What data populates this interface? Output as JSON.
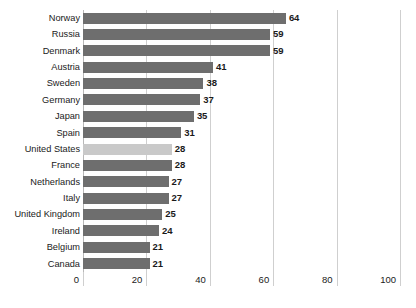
{
  "chart_data": {
    "type": "bar",
    "orientation": "horizontal",
    "title": "",
    "subtitle": "",
    "xlabel": "",
    "ylabel": "",
    "xlim": [
      0,
      100
    ],
    "xticks": [
      0,
      20,
      40,
      60,
      80,
      100
    ],
    "xtick_labels": [
      "0",
      "20",
      "40",
      "60",
      "80",
      "100"
    ],
    "grid": "vertical",
    "legend": "none",
    "categories": [
      "Norway",
      "Russia",
      "Denmark",
      "Austria",
      "Sweden",
      "Germany",
      "Japan",
      "Spain",
      "United States",
      "France",
      "Netherlands",
      "Italy",
      "United Kingdom",
      "Ireland",
      "Belgium",
      "Canada"
    ],
    "values": [
      64,
      59,
      59,
      41,
      38,
      37,
      35,
      31,
      28,
      28,
      27,
      27,
      25,
      24,
      21,
      21
    ],
    "value_labels": [
      "64",
      "59",
      "59",
      "41",
      "38",
      "37",
      "35",
      "31",
      "28",
      "28",
      "27",
      "27",
      "25",
      "24",
      "21",
      "21"
    ],
    "highlighted_category": "United States",
    "colors": {
      "bar": "#6e6e6e",
      "bar_highlight": "#c9c9c9",
      "gridline": "#cfcfcf",
      "axis": "#b8b8b8",
      "text": "#1a1a1a",
      "background": "#ffffff"
    }
  }
}
